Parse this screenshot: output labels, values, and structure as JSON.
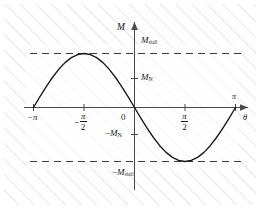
{
  "chart_data": {
    "type": "line",
    "title": "",
    "xlabel": "θ",
    "ylabel": "M",
    "xlim": [
      -3.6,
      3.95
    ],
    "ylim": [
      -1.62,
      1.62
    ],
    "grid": false,
    "legend": null,
    "x": [
      -3.1416,
      -2.9452,
      -2.7489,
      -2.5525,
      -2.3562,
      -2.1598,
      -1.9635,
      -1.7671,
      -1.5708,
      -1.3744,
      -1.1781,
      -0.9817,
      -0.7854,
      -0.589,
      -0.3927,
      -0.1963,
      0.0,
      0.1963,
      0.3927,
      0.589,
      0.7854,
      0.9817,
      1.1781,
      1.3744,
      1.5708,
      1.7671,
      1.9635,
      2.1598,
      2.3562,
      2.5525,
      2.7489,
      2.9452,
      3.1416
    ],
    "y": [
      0.0,
      0.1951,
      0.3827,
      0.5556,
      0.7071,
      0.8315,
      0.9239,
      0.9808,
      1.0,
      0.9808,
      0.9239,
      0.8315,
      0.7071,
      0.5556,
      0.3827,
      0.1951,
      0.0,
      -0.1951,
      -0.3827,
      -0.5556,
      -0.7071,
      -0.8315,
      -0.9239,
      -0.9808,
      -1.0,
      -0.9808,
      -0.9239,
      -0.8315,
      -0.7071,
      -0.5556,
      -0.3827,
      -0.1951,
      0.0
    ],
    "xticks": [
      {
        "value": -3.1416,
        "label": "−π",
        "kind": "plain"
      },
      {
        "value": -1.5708,
        "label": "−π/2",
        "kind": "fraction",
        "numerator": "π",
        "denominator": "2",
        "sign": "−"
      },
      {
        "value": 0.0,
        "label": "0",
        "kind": "plain"
      },
      {
        "value": 1.5708,
        "label": "π/2",
        "kind": "fraction",
        "numerator": "π",
        "denominator": "2",
        "sign": ""
      },
      {
        "value": 3.1416,
        "label": "π",
        "kind": "plain"
      }
    ],
    "yticks": [
      {
        "value": 1.0,
        "label": "M_stall",
        "symbol": "M",
        "subscript": "stall",
        "sign": "",
        "dashed": true
      },
      {
        "value": 0.5,
        "label": "M_N",
        "symbol": "M",
        "subscript": "N",
        "sign": "",
        "dashed": false
      },
      {
        "value": -0.5,
        "label": "-M_N",
        "symbol": "M",
        "subscript": "N",
        "sign": "−",
        "dashed": false
      },
      {
        "value": -1.0,
        "label": "-M_stall",
        "symbol": "M",
        "subscript": "stall",
        "sign": "−",
        "dashed": true
      }
    ],
    "annotations": [
      {
        "name": "y-axis-label",
        "text": "M"
      },
      {
        "name": "x-axis-label",
        "text": "θ"
      }
    ],
    "colors": {
      "curve": "#1a1a1a",
      "axis": "#404040",
      "dashed": "#3a3a3a",
      "hatch": "#e8e8e8",
      "background": "#ffffff",
      "text": "#1a1a1a"
    }
  },
  "axes": {
    "y_label": "M",
    "x_label": "θ",
    "origin_label": "0"
  },
  "labels": {
    "m_stall": {
      "symbol": "M",
      "sub": "stall"
    },
    "m_n": {
      "symbol": "M",
      "sub": "N"
    },
    "neg_m_n": {
      "sign": "−",
      "symbol": "M",
      "sub": "N"
    },
    "neg_m_stall": {
      "sign": "−",
      "symbol": "M",
      "sub": "stall"
    },
    "neg_pi": "−π",
    "pi": "π",
    "pi_num": "π",
    "pi_den": "2",
    "neg_sign": "−"
  }
}
